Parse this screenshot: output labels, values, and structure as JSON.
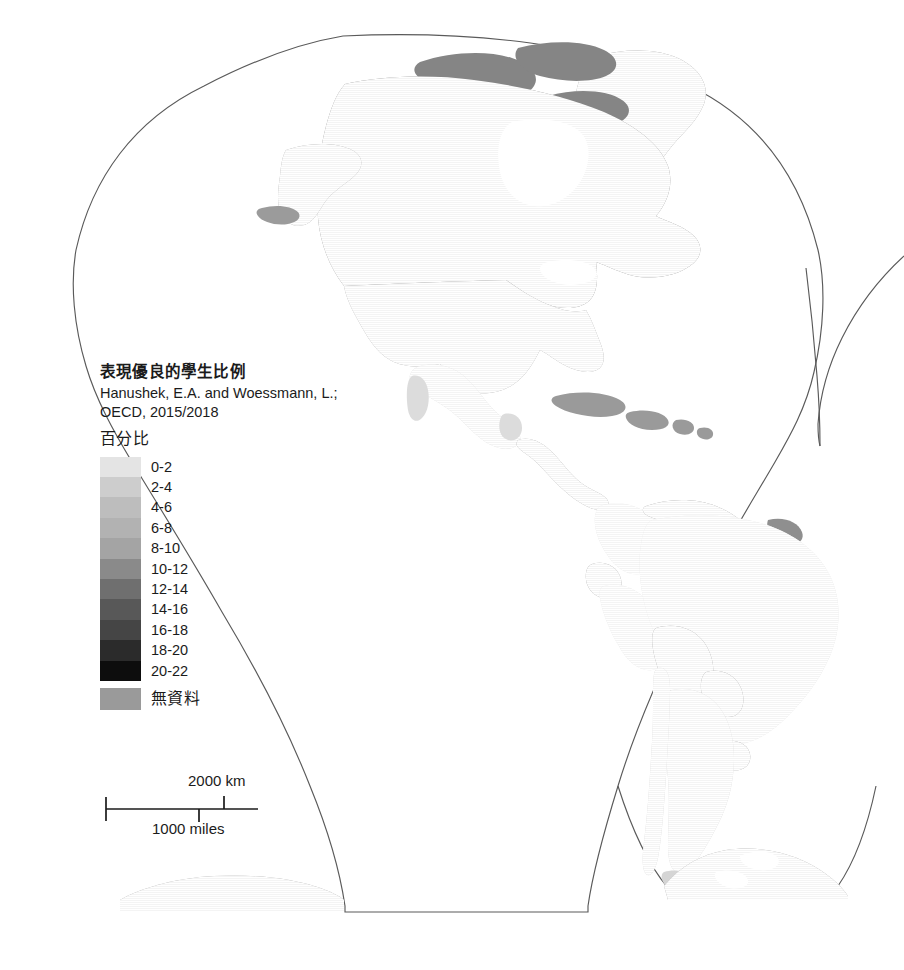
{
  "legend": {
    "title": "表現優良的學生比例",
    "source": "Hanushek, E.A. and Woessmann, L.; OECD, 2015/2018",
    "units_label": "百分比",
    "no_data_label": "無資料",
    "classes": [
      {
        "label": "0-2",
        "color": "#e4e4e4"
      },
      {
        "label": "2-4",
        "color": "#cdcdcd"
      },
      {
        "label": "4-6",
        "color": "#bdbdbd"
      },
      {
        "label": "6-8",
        "color": "#b2b2b2"
      },
      {
        "label": "8-10",
        "color": "#a4a4a4"
      },
      {
        "label": "10-12",
        "color": "#8a8a8a"
      },
      {
        "label": "12-14",
        "color": "#6f6f6f"
      },
      {
        "label": "14-16",
        "color": "#585858"
      },
      {
        "label": "16-18",
        "color": "#454545"
      },
      {
        "label": "18-20",
        "color": "#2b2b2b"
      },
      {
        "label": "20-22",
        "color": "#0d0d0d"
      }
    ],
    "no_data_color": "#9a9a9a"
  },
  "scalebar": {
    "km_label": "2000 km",
    "miles_label": "1000 miles"
  },
  "map": {
    "background_color": "#ffffff",
    "outline_color": "#5a5a5a",
    "graticule_color": "#d8d8d8",
    "region_fills": {
      "canada": "#7b7b7b",
      "united_states": "#9b9b9b",
      "mexico": "#dcdcdc",
      "central_america_no_data": "#9a9a9a",
      "caribbean_no_data": "#9a9a9a",
      "greenland_no_data": "#8f8f8f",
      "brazil": "#e6e6e6",
      "peru": "#e6e6e6",
      "colombia": "#e6e6e6",
      "venezuela_no_data": "#8f8f8f",
      "guyanas_no_data": "#8f8f8f",
      "ecuador_no_data": "#8f8f8f",
      "bolivia_no_data": "#8f8f8f",
      "paraguay_no_data": "#8f8f8f",
      "uruguay_no_data": "#8f8f8f",
      "argentina": "#d5d5d5",
      "chile": "#d5d5d5",
      "antarctica_no_data": "#9a9a9a"
    }
  },
  "chart_data": {
    "type": "map",
    "title": "表現優良的學生比例",
    "subtitle": "Hanushek, E.A. and Woessmann, L.; OECD, 2015/2018",
    "value_units": "百分比",
    "projection": "interrupted-goode-homolosine",
    "visible_extent": "Americas lobe (Western Hemisphere) plus Antarctic segments",
    "legend_position": "left-center",
    "classes": [
      "0-2",
      "2-4",
      "4-6",
      "6-8",
      "8-10",
      "10-12",
      "12-14",
      "14-16",
      "16-18",
      "18-20",
      "20-22",
      "無資料"
    ],
    "class_colors": [
      "#e4e4e4",
      "#cdcdcd",
      "#bdbdbd",
      "#b2b2b2",
      "#a4a4a4",
      "#8a8a8a",
      "#6f6f6f",
      "#585858",
      "#454545",
      "#2b2b2b",
      "#0d0d0d",
      "#9a9a9a"
    ],
    "regions": [
      {
        "name": "Canada",
        "class": "12-14",
        "color": "#7b7b7b"
      },
      {
        "name": "United States",
        "class": "10-12",
        "color": "#9b9b9b"
      },
      {
        "name": "Mexico",
        "class": "0-2",
        "color": "#dcdcdc"
      },
      {
        "name": "Guatemala",
        "class": "無資料",
        "color": "#9a9a9a"
      },
      {
        "name": "Belize",
        "class": "無資料",
        "color": "#9a9a9a"
      },
      {
        "name": "Honduras",
        "class": "無資料",
        "color": "#9a9a9a"
      },
      {
        "name": "El Salvador",
        "class": "無資料",
        "color": "#9a9a9a"
      },
      {
        "name": "Nicaragua",
        "class": "無資料",
        "color": "#9a9a9a"
      },
      {
        "name": "Costa Rica",
        "class": "無資料",
        "color": "#9a9a9a"
      },
      {
        "name": "Panama",
        "class": "無資料",
        "color": "#9a9a9a"
      },
      {
        "name": "Cuba",
        "class": "無資料",
        "color": "#9a9a9a"
      },
      {
        "name": "Hispaniola",
        "class": "無資料",
        "color": "#9a9a9a"
      },
      {
        "name": "Greenland",
        "class": "無資料",
        "color": "#8f8f8f"
      },
      {
        "name": "Colombia",
        "class": "0-2",
        "color": "#e6e6e6"
      },
      {
        "name": "Venezuela",
        "class": "無資料",
        "color": "#8f8f8f"
      },
      {
        "name": "Guyana",
        "class": "無資料",
        "color": "#8f8f8f"
      },
      {
        "name": "Suriname",
        "class": "無資料",
        "color": "#8f8f8f"
      },
      {
        "name": "French Guiana",
        "class": "無資料",
        "color": "#8f8f8f"
      },
      {
        "name": "Ecuador",
        "class": "無資料",
        "color": "#8f8f8f"
      },
      {
        "name": "Peru",
        "class": "0-2",
        "color": "#e6e6e6"
      },
      {
        "name": "Brazil",
        "class": "0-2",
        "color": "#e6e6e6"
      },
      {
        "name": "Bolivia",
        "class": "無資料",
        "color": "#8f8f8f"
      },
      {
        "name": "Paraguay",
        "class": "無資料",
        "color": "#8f8f8f"
      },
      {
        "name": "Uruguay",
        "class": "無資料",
        "color": "#8f8f8f"
      },
      {
        "name": "Argentina",
        "class": "0-2",
        "color": "#d5d5d5"
      },
      {
        "name": "Chile",
        "class": "0-2",
        "color": "#d5d5d5"
      },
      {
        "name": "Antarctica",
        "class": "無資料",
        "color": "#9a9a9a"
      }
    ],
    "scalebar": {
      "km": "2000 km",
      "miles": "1000 miles"
    }
  }
}
